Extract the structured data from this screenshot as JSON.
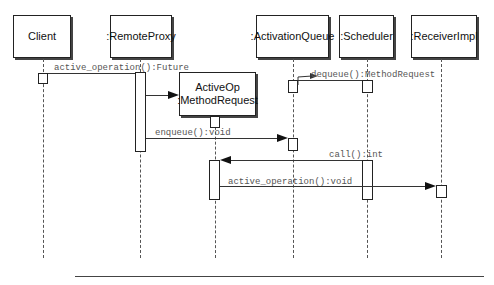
{
  "diagram": {
    "type": "UML sequence diagram",
    "objects": [
      {
        "id": "client",
        "label": "Client"
      },
      {
        "id": "remote_proxy",
        "label": ":RemoteProxy"
      },
      {
        "id": "active_op",
        "label_line1": "ActiveOp",
        "label_line2": ":MethodRequest"
      },
      {
        "id": "activation_queue",
        "label": ":ActivationQueue"
      },
      {
        "id": "scheduler",
        "label": ":Scheduler"
      },
      {
        "id": "receiver_impl",
        "label": ":ReceiverImpl"
      }
    ],
    "messages": [
      {
        "from": "Client",
        "to": ":RemoteProxy",
        "label": "active_operation():Future"
      },
      {
        "from": ":RemoteProxy",
        "to": "ActiveOp :MethodRequest",
        "label": "",
        "kind": "create"
      },
      {
        "from": ":Scheduler",
        "to": ":ActivationQueue",
        "label": "dequeue():MethodRequest"
      },
      {
        "from": ":RemoteProxy",
        "to": ":ActivationQueue",
        "label": "enqueue():void"
      },
      {
        "from": ":Scheduler",
        "to": "ActiveOp :MethodRequest",
        "label": "call():int"
      },
      {
        "from": "ActiveOp :MethodRequest",
        "to": ":ReceiverImpl",
        "label": "active_operation():void"
      }
    ]
  }
}
